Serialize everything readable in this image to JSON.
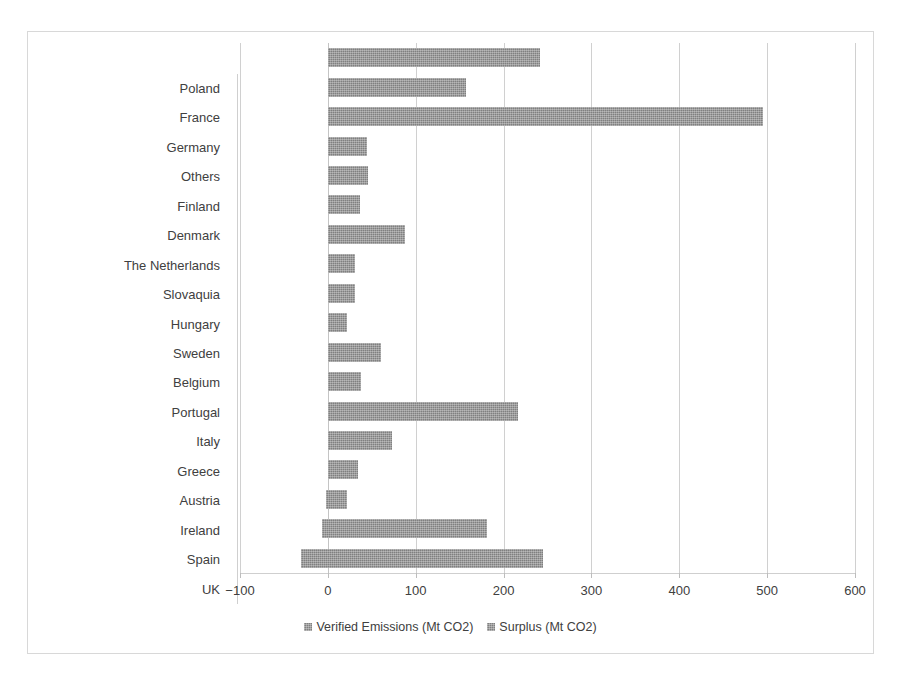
{
  "chart_data": {
    "type": "bar",
    "orientation": "horizontal",
    "title": "",
    "xlabel": "",
    "ylabel": "",
    "xlim": [
      -100,
      600
    ],
    "xticks": [
      "−100",
      "0",
      "100",
      "200",
      "300",
      "400",
      "500",
      "600"
    ],
    "xtick_values": [
      -100,
      0,
      100,
      200,
      300,
      400,
      500,
      600
    ],
    "grid": true,
    "legend_position": "bottom",
    "legend": [
      "Verified Emissions (Mt CO2)",
      "Surplus (Mt CO2)"
    ],
    "categories": [
      "Poland",
      "France",
      "Germany",
      "Others",
      "Finland",
      "Denmark",
      "The Netherlands",
      "Slovaquia",
      "Hungary",
      "Sweden",
      "Belgium",
      "Portugal",
      "Italy",
      "Greece",
      "Austria",
      "Ireland",
      "Spain",
      "UK"
    ],
    "series": [
      {
        "name": "Verified Emissions (Mt CO2)",
        "color": "#808080",
        "bars": [
          {
            "category": "Poland",
            "start": 0,
            "end": 241
          },
          {
            "category": "France",
            "start": 0,
            "end": 157
          },
          {
            "category": "Germany",
            "start": 0,
            "end": 495
          },
          {
            "category": "Others",
            "start": 0,
            "end": 44
          },
          {
            "category": "Finland",
            "start": 0,
            "end": 46
          },
          {
            "category": "Denmark",
            "start": 0,
            "end": 37
          },
          {
            "category": "The Netherlands",
            "start": 0,
            "end": 88
          },
          {
            "category": "Slovaquia",
            "start": 0,
            "end": 31
          },
          {
            "category": "Hungary",
            "start": 0,
            "end": 31
          },
          {
            "category": "Sweden",
            "start": 0,
            "end": 22
          },
          {
            "category": "Belgium",
            "start": 0,
            "end": 60
          },
          {
            "category": "Portugal",
            "start": 0,
            "end": 38
          },
          {
            "category": "Italy",
            "start": 0,
            "end": 216
          },
          {
            "category": "Greece",
            "start": 0,
            "end": 73
          },
          {
            "category": "Austria",
            "start": 0,
            "end": 34
          },
          {
            "category": "Ireland",
            "start": -2,
            "end": 22
          },
          {
            "category": "Spain",
            "start": -7,
            "end": 181
          },
          {
            "category": "UK",
            "start": -31,
            "end": 245
          }
        ]
      }
    ],
    "values": [
      241,
      157,
      495,
      44,
      46,
      37,
      88,
      31,
      31,
      22,
      60,
      38,
      216,
      73,
      34,
      22,
      181,
      245
    ]
  }
}
